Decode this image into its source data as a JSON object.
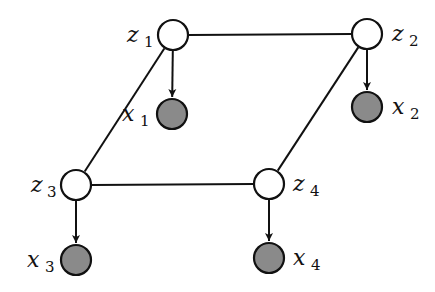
{
  "diagram": {
    "type": "graphical-model",
    "colors": {
      "stroke": "#111111",
      "latent_fill": "#ffffff",
      "observed_fill": "#8a8a8a",
      "background": "#ffffff"
    },
    "node_radius": 16,
    "nodes": [
      {
        "id": "z1",
        "var": "z",
        "sub": "1",
        "kind": "latent",
        "cx": 173,
        "cy": 35,
        "lx": 127,
        "ly": 42,
        "sx": 144,
        "sy": 47
      },
      {
        "id": "z2",
        "var": "z",
        "sub": "2",
        "kind": "latent",
        "cx": 367,
        "cy": 34,
        "lx": 392,
        "ly": 41,
        "sx": 409,
        "sy": 46
      },
      {
        "id": "z3",
        "var": "z",
        "sub": "3",
        "kind": "latent",
        "cx": 76,
        "cy": 185,
        "lx": 31,
        "ly": 192,
        "sx": 47,
        "sy": 197
      },
      {
        "id": "z4",
        "var": "z",
        "sub": "4",
        "kind": "latent",
        "cx": 269,
        "cy": 184,
        "lx": 293,
        "ly": 191,
        "sx": 310,
        "sy": 196
      },
      {
        "id": "x1",
        "var": "x",
        "sub": "1",
        "kind": "observed",
        "cx": 172,
        "cy": 114,
        "lx": 122,
        "ly": 121,
        "sx": 140,
        "sy": 126
      },
      {
        "id": "x2",
        "var": "x",
        "sub": "2",
        "kind": "observed",
        "cx": 367,
        "cy": 107,
        "lx": 392,
        "ly": 114,
        "sx": 410,
        "sy": 119
      },
      {
        "id": "x3",
        "var": "x",
        "sub": "3",
        "kind": "observed",
        "cx": 76,
        "cy": 260,
        "lx": 27,
        "ly": 267,
        "sx": 45,
        "sy": 272
      },
      {
        "id": "x4",
        "var": "x",
        "sub": "4",
        "kind": "observed",
        "cx": 269,
        "cy": 258,
        "lx": 293,
        "ly": 265,
        "sx": 311,
        "sy": 270
      }
    ],
    "undirected_edges": [
      {
        "from": "z1",
        "to": "z2"
      },
      {
        "from": "z1",
        "to": "z3"
      },
      {
        "from": "z2",
        "to": "z4"
      },
      {
        "from": "z3",
        "to": "z4"
      }
    ],
    "directed_edges": [
      {
        "from": "z1",
        "to": "x1"
      },
      {
        "from": "z2",
        "to": "x2"
      },
      {
        "from": "z3",
        "to": "x3"
      },
      {
        "from": "z4",
        "to": "x4"
      }
    ]
  }
}
